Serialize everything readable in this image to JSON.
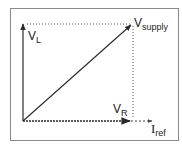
{
  "diagram": {
    "type": "phasor-diagram",
    "frame": {
      "stroke": "#8a8a8a"
    },
    "colors": {
      "vector": "#2a2a2a",
      "dotted": "#555555",
      "text": "#222222"
    },
    "labels": {
      "vl": {
        "main": "V",
        "sub": "L"
      },
      "vsupply": {
        "main": "V",
        "sub": "supply"
      },
      "vr": {
        "main": "V",
        "sub": "R"
      },
      "iref": {
        "main": "I",
        "sub": "ref"
      }
    },
    "vectors": [
      {
        "name": "V_L",
        "from": [
          23,
          121
        ],
        "to": [
          23,
          24
        ],
        "style": "solid"
      },
      {
        "name": "V_supply",
        "from": [
          23,
          121
        ],
        "to": [
          132,
          24
        ],
        "style": "solid"
      },
      {
        "name": "V_R",
        "from": [
          23,
          121
        ],
        "to": [
          132,
          121
        ],
        "style": "dashed-bold"
      },
      {
        "name": "I_ref",
        "from": [
          132,
          121
        ],
        "to": [
          153,
          121
        ],
        "style": "dashed"
      }
    ],
    "projection_lines": [
      {
        "from": [
          23,
          24
        ],
        "to": [
          132,
          24
        ],
        "style": "dotted"
      },
      {
        "from": [
          132,
          24
        ],
        "to": [
          132,
          121
        ],
        "style": "dotted"
      }
    ]
  }
}
